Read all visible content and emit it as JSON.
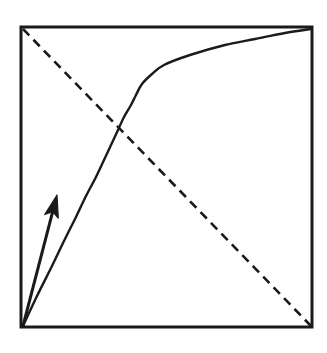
{
  "figure": {
    "title": "",
    "caption": "",
    "background_color": "#ffffff",
    "ink_color": "#1a1a1a"
  },
  "chart_data": {
    "type": "line",
    "title": "",
    "subtitle": "",
    "xlabel": "",
    "ylabel": "",
    "xlim": [
      0,
      1
    ],
    "ylim": [
      0,
      1
    ],
    "grid": false,
    "legend_position": "none",
    "axis_ticks": {
      "x": [],
      "y": []
    },
    "frame": {
      "name": "plot-frame",
      "style": "solid",
      "color": "#1a1a1a",
      "line_width_px": 3,
      "left_px": 21,
      "top_px": 27,
      "right_px": 312,
      "bottom_px": 327
    },
    "series": [
      {
        "name": "concave-increasing-curve",
        "label": "",
        "style": "solid",
        "color": "#1a1a1a",
        "line_width_px": 2.4,
        "description": "Concave-down increasing curve from lower-left corner to upper-right corner",
        "x": [
          0.0,
          0.05,
          0.1,
          0.15,
          0.2,
          0.25,
          0.3,
          0.35,
          0.4,
          0.45,
          0.5,
          0.55,
          0.6,
          0.65,
          0.7,
          0.75,
          0.8,
          0.85,
          0.9,
          0.95,
          1.0
        ],
        "y": [
          0.0,
          0.1,
          0.2,
          0.285,
          0.365,
          0.435,
          0.5,
          0.555,
          0.605,
          0.655,
          0.7,
          0.74,
          0.775,
          0.81,
          0.845,
          0.875,
          0.905,
          0.935,
          0.96,
          0.98,
          1.0
        ],
        "points_px": [
          [
            23,
            326
          ],
          [
            37,
            296
          ],
          [
            52,
            266
          ],
          [
            64,
            241
          ],
          [
            76,
            217
          ],
          [
            86,
            196
          ],
          [
            96,
            177
          ],
          [
            104,
            160
          ],
          [
            111,
            145
          ],
          [
            118,
            130
          ],
          [
            124,
            117
          ],
          [
            131,
            105
          ],
          [
            136,
            95
          ],
          [
            142,
            84
          ],
          [
            152,
            74
          ],
          [
            164,
            65
          ],
          [
            190,
            55
          ],
          [
            225,
            45
          ],
          [
            255,
            39
          ],
          [
            285,
            33
          ],
          [
            311,
            29
          ]
        ]
      },
      {
        "name": "dashed-anti-diagonal",
        "label": "",
        "style": "dashed",
        "color": "#1a1a1a",
        "line_width_px": 2.6,
        "dash_pattern_px": [
          9,
          6
        ],
        "description": "Straight dashed line from upper-left corner to lower-right corner",
        "x": [
          0.0,
          1.0
        ],
        "y": [
          1.0,
          0.0
        ],
        "points_px": [
          [
            23,
            29
          ],
          [
            311,
            326
          ]
        ]
      }
    ],
    "annotations": [
      {
        "name": "direction-arrow",
        "type": "arrow",
        "label": "",
        "color": "#1a1a1a",
        "line_width_px": 3,
        "description": "Bold arrow from lower-left origin pointing up and to the right, above the curve",
        "tail_px": [
          23,
          326
        ],
        "tip_px": [
          57,
          195
        ],
        "head_length_px": 22,
        "head_width_px": 14
      },
      {
        "name": "curve-dashed-intersection",
        "type": "point",
        "label": "",
        "description": "Crossing point of the solid curve and the dashed diagonal",
        "point_px": [
          140,
          157
        ],
        "x": 0.41,
        "y": 0.59
      }
    ]
  }
}
